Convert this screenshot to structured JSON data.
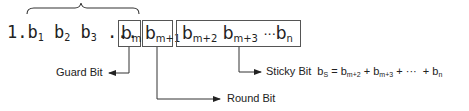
{
  "prefix": {
    "lead": "1.",
    "bits": [
      {
        "base": "b",
        "sub": "1"
      },
      {
        "base": "b",
        "sub": "2"
      },
      {
        "base": "b",
        "sub": "3"
      }
    ],
    "ellipsis": "..."
  },
  "boxes": {
    "guard": {
      "base": "b",
      "sub": "m"
    },
    "round": {
      "base": "b",
      "sub": "m+1"
    },
    "sticky": {
      "bits": [
        {
          "base": "b",
          "sub": "m+2"
        },
        {
          "base": "b",
          "sub": "m+3"
        }
      ],
      "ellipsis": "···",
      "last": {
        "base": "b",
        "sub": "n"
      }
    }
  },
  "labels": {
    "guard": "Guard Bit",
    "round": "Round Bit",
    "sticky": "Sticky Bit",
    "sticky_formula": {
      "lhs": {
        "base": "b",
        "sub": "S"
      },
      "eq": "=",
      "terms": [
        {
          "base": "b",
          "sub": "m+2"
        },
        {
          "base": "b",
          "sub": "m+3"
        }
      ],
      "plus": "+",
      "ellipsis": "···",
      "last": {
        "base": "b",
        "sub": "n"
      }
    }
  },
  "colors": {
    "line": "#333333",
    "box_border": "#555555",
    "text": "#222222"
  }
}
